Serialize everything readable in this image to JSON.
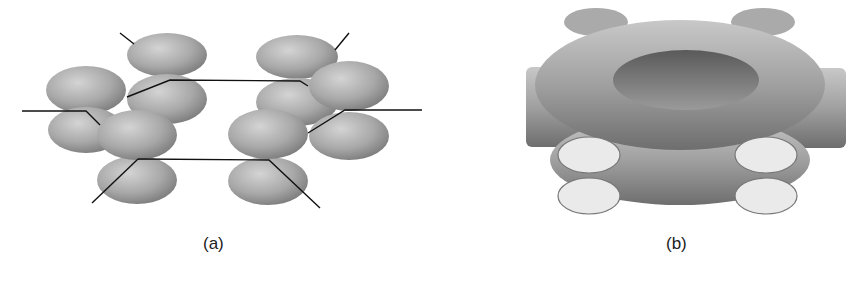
{
  "figure": {
    "panels": [
      {
        "id": "a",
        "label": "(a)",
        "description": "p orbitals on six carbon atoms of benzene ring"
      },
      {
        "id": "b",
        "label": "(b)",
        "description": "delocalized pi molecular orbital"
      }
    ]
  },
  "colors": {
    "orbital": "#9a9a9a",
    "bond": "#111111",
    "background": "#ffffff"
  }
}
